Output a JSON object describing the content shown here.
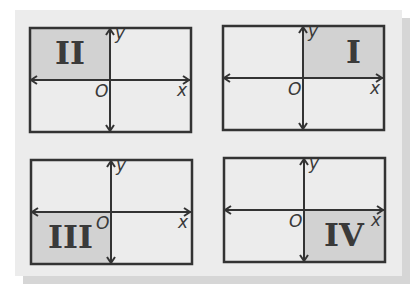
{
  "colors": {
    "background": "#ececec",
    "shaded": "#d2d2d2",
    "line": "#333333"
  },
  "quadrants": [
    {
      "id": "II",
      "label": "II",
      "shaded": "top-left",
      "axes": {
        "x": "x",
        "y": "y",
        "origin": "O"
      }
    },
    {
      "id": "I",
      "label": "I",
      "shaded": "top-right",
      "axes": {
        "x": "x",
        "y": "y",
        "origin": "O"
      }
    },
    {
      "id": "III",
      "label": "III",
      "shaded": "bottom-left",
      "axes": {
        "x": "x",
        "y": "y",
        "origin": "O"
      }
    },
    {
      "id": "IV",
      "label": "IV",
      "shaded": "bottom-right",
      "axes": {
        "x": "x",
        "y": "y",
        "origin": "O"
      }
    }
  ]
}
